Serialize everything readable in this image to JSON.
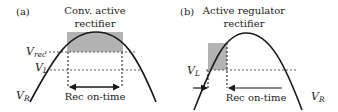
{
  "panel_a": {
    "label": "(a)",
    "title_line1": "Conv. active",
    "title_line2": "rectifier",
    "vrec_main": "V",
    "vrec_sub": "rec",
    "vl_main": "V",
    "vl_sub": "L",
    "vr_main": "V",
    "vr_sub": "R",
    "on_time_label": "Rec on-time"
  },
  "panel_b": {
    "label": "(b)",
    "title_line1": "Active regulator",
    "title_line2": "rectifier",
    "vl_main": "V",
    "vl_sub": "L",
    "vr_main": "V",
    "vr_sub": "R",
    "on_time_label": "Rec on-time"
  },
  "colors": {
    "curve": "#1a1a1a",
    "shade": "#b3b3b3",
    "dotted": "#555555"
  }
}
